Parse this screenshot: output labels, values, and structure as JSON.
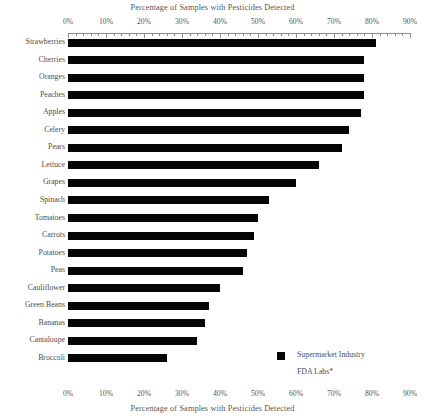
{
  "chart_data": {
    "type": "bar",
    "orientation": "horizontal",
    "title": "Percentage of Samples with Pesticides Detected",
    "xlabel": "Percentage of Samples with Pesticides Detected",
    "ylabel": "",
    "xlim": [
      0,
      90
    ],
    "grid": false,
    "legend_position": "bottom-right",
    "axis_top_label": "Percentage of Samples with Pesticides Detected",
    "axis_bottom_label": "Percentage of Samples with Pesticides Detected",
    "tick_labels": [
      "0%",
      "10%",
      "20%",
      "30%",
      "40%",
      "50%",
      "60%",
      "70%",
      "80%",
      "90%"
    ],
    "tick_values": [
      0,
      10,
      20,
      30,
      40,
      50,
      60,
      70,
      80,
      90
    ],
    "categories": [
      "Strawberries",
      "Cherries",
      "Oranges",
      "Peaches",
      "Apples",
      "Celery",
      "Pears",
      "Lettuce",
      "Grapes",
      "Spinach",
      "Tomatoes",
      "Carrots",
      "Potatoes",
      "Peas",
      "Cauliflower",
      "Green Beans",
      "Bananas",
      "Cantaloupe",
      "Broccoli"
    ],
    "series": [
      {
        "name": "Supermarket Industry",
        "color": "#050505",
        "values": [
          81,
          78,
          78,
          78,
          77,
          74,
          72,
          66,
          60,
          53,
          50,
          49,
          47,
          46,
          40,
          37,
          36,
          34,
          26
        ]
      }
    ],
    "legend": [
      {
        "label": "Supermarket Industry",
        "marker": "filled-square",
        "color": "#050505"
      },
      {
        "label": "FDA Labs*",
        "marker": "none",
        "color": "#050505"
      }
    ]
  }
}
